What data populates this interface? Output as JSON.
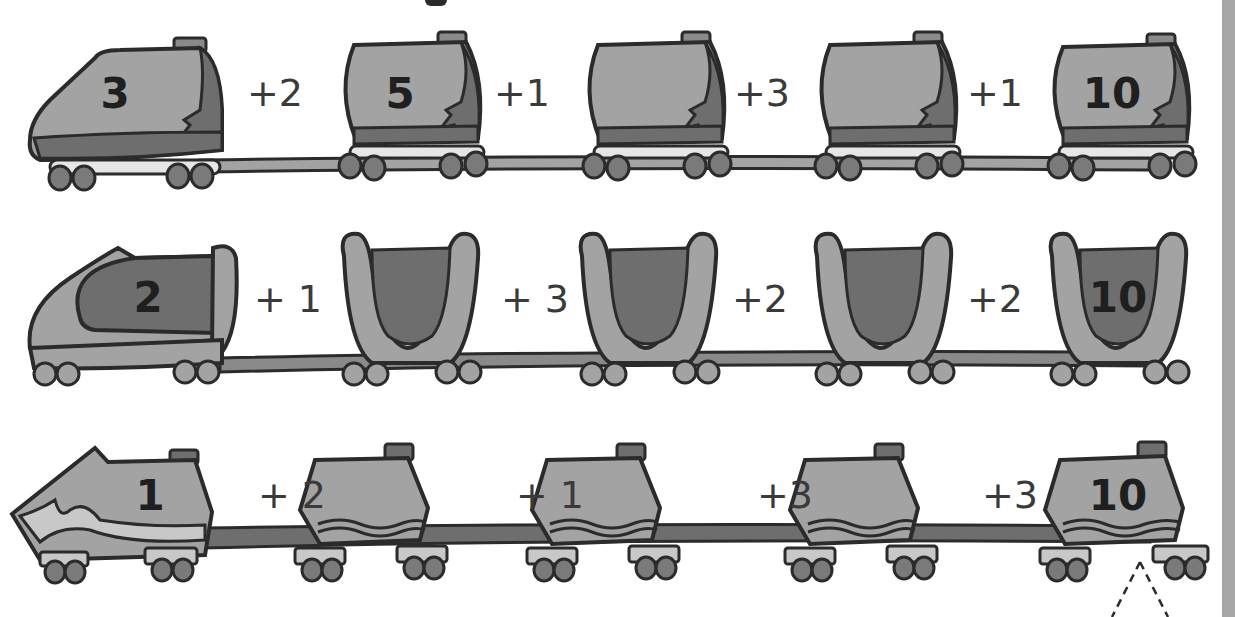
{
  "worksheet": {
    "type": "number-train addition puzzle",
    "colors": {
      "body_fill": "#a3a3a3",
      "body_dark": "#6e6e6e",
      "outline": "#2b2b2b",
      "text": "#1f1f1f",
      "side_strip": "#a6a6a6",
      "background": "#ffffff"
    },
    "rows": [
      {
        "style": "tanker",
        "cars": [
          "3",
          "5",
          "",
          "",
          "10"
        ],
        "operators": [
          "+2",
          "+1",
          "+3",
          "+1"
        ]
      },
      {
        "style": "hopper",
        "cars": [
          "2",
          "",
          "",
          "",
          "10"
        ],
        "operators": [
          "+ 1",
          "+ 3",
          "+2",
          "+2"
        ]
      },
      {
        "style": "boxcar",
        "cars": [
          "1",
          "",
          "",
          "",
          "10"
        ],
        "operators": [
          "+ 2",
          "+ 1",
          "+3",
          "+3"
        ]
      }
    ]
  }
}
